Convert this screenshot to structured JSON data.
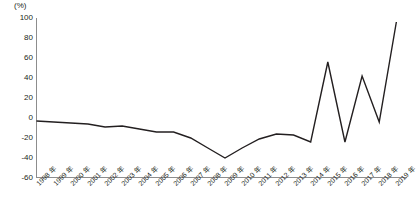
{
  "chart": {
    "unit_label": "(%)",
    "axis_color": "#8d8d8d",
    "line_color": "#231f20",
    "background": "#ffffff"
  },
  "chart_data": {
    "type": "line",
    "title": "",
    "subtitle": "",
    "xlabel": "",
    "ylabel": "(%)",
    "unit": "%",
    "grid": false,
    "legend": "none",
    "ylim": [
      -60,
      100
    ],
    "ytick_step": 20,
    "yticks": [
      100,
      80,
      60,
      40,
      20,
      0,
      -20,
      -40,
      -60
    ],
    "ytick_labels": [
      "100",
      "80",
      "60",
      "40",
      "20",
      "0",
      "-20",
      "-40",
      "-60"
    ],
    "categories": [
      "1998 年",
      "1999 年",
      "2000 年",
      "2001 年",
      "2002 年",
      "2003 年",
      "2004 年",
      "2005 年",
      "2006 年",
      "2007 年",
      "2008 年",
      "2009 年",
      "2010 年",
      "2011 年",
      "2012 年",
      "2013 年",
      "2014 年",
      "2015 年",
      "2016 年",
      "2017 年",
      "2018 年",
      "2019 年"
    ],
    "x": [
      1998,
      1999,
      2000,
      2001,
      2002,
      2003,
      2004,
      2005,
      2006,
      2007,
      2008,
      2009,
      2010,
      2011,
      2012,
      2013,
      2014,
      2015,
      2016,
      2017,
      2018,
      2019
    ],
    "values": [
      -3,
      -4,
      -5,
      -6,
      -9,
      -8,
      -11,
      -14,
      -14,
      -20,
      -30,
      -40,
      -30,
      -21,
      -16,
      -17,
      -24,
      56,
      -24,
      42,
      -4,
      96
    ],
    "series": [
      {
        "name": "",
        "values": [
          -3,
          -4,
          -5,
          -6,
          -9,
          -8,
          -11,
          -14,
          -14,
          -20,
          -30,
          -40,
          -30,
          -21,
          -16,
          -17,
          -24,
          56,
          -24,
          42,
          -4,
          96
        ]
      }
    ]
  }
}
